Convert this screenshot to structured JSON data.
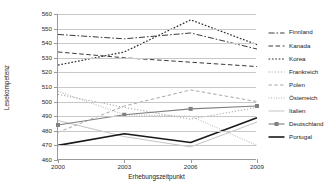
{
  "chart_data": {
    "type": "line",
    "title": "",
    "xlabel": "Erhebungszeitpunkt",
    "ylabel": "Lesekompetenz",
    "x": [
      2000,
      2003,
      2006,
      2009
    ],
    "categories": [
      "2000",
      "2003",
      "2006",
      "2009"
    ],
    "xlim": [
      2000,
      2009
    ],
    "ylim": [
      460,
      560
    ],
    "yticks": [
      460,
      470,
      480,
      490,
      500,
      510,
      520,
      530,
      540,
      550,
      560
    ],
    "grid": true,
    "legend_position": "right",
    "series": [
      {
        "name": "Finnland",
        "values": [
          546,
          543,
          547,
          536
        ],
        "style": "dash-dot",
        "color": "#3a3a3a",
        "marker": "none"
      },
      {
        "name": "Kanada",
        "values": [
          534,
          530,
          527,
          524
        ],
        "style": "dashed",
        "color": "#3a3a3a",
        "marker": "none"
      },
      {
        "name": "Korea",
        "values": [
          525,
          534,
          556,
          539
        ],
        "style": "dotted",
        "color": "#2e2e2e",
        "marker": "none"
      },
      {
        "name": "Frankreich",
        "values": [
          505,
          496,
          488,
          496
        ],
        "style": "fine-dotted",
        "color": "#8c8c8c",
        "marker": "none"
      },
      {
        "name": "Polen",
        "values": [
          479,
          497,
          508,
          500
        ],
        "style": "dash-sparse",
        "color": "#8f8f8f",
        "marker": "none"
      },
      {
        "name": "Österreich",
        "values": [
          507,
          491,
          490,
          470
        ],
        "style": "dot-dense",
        "color": "#9a9a9a",
        "marker": "none"
      },
      {
        "name": "Italien",
        "values": [
          487,
          476,
          469,
          486
        ],
        "style": "solid-thin",
        "color": "#b4b4b4",
        "marker": "none"
      },
      {
        "name": "Deutschland",
        "values": [
          484,
          491,
          495,
          497
        ],
        "style": "solid-marker",
        "color": "#808080",
        "marker": "square"
      },
      {
        "name": "Portugal",
        "values": [
          470,
          478,
          472,
          489
        ],
        "style": "solid-bold",
        "color": "#1a1a1a",
        "marker": "none"
      }
    ]
  },
  "legend": {
    "items": [
      {
        "label": "Finnland"
      },
      {
        "label": "Kanada"
      },
      {
        "label": "Korea"
      },
      {
        "label": "Frankreich"
      },
      {
        "label": "Polen"
      },
      {
        "label": "Österreich"
      },
      {
        "label": "Italien"
      },
      {
        "label": "Deutschland"
      },
      {
        "label": "Portugal"
      }
    ]
  }
}
